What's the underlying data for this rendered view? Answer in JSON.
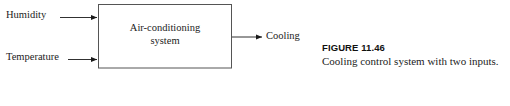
{
  "figure": {
    "block": {
      "label_line1": "Air-conditioning",
      "label_line2": "system",
      "border_color": "#555555",
      "fill_color": "#ffffff"
    },
    "inputs": [
      {
        "label": "Humidity",
        "arrow_name": "humidity-input-arrow"
      },
      {
        "label": "Temperature",
        "arrow_name": "temperature-input-arrow"
      }
    ],
    "outputs": [
      {
        "label": "Cooling",
        "arrow_name": "cooling-output-arrow"
      }
    ],
    "line_color": "#1a1a1a"
  },
  "caption": {
    "title": "FIGURE 11.46",
    "text": "Cooling control system with two inputs."
  },
  "page": {
    "background": "#ffffff"
  }
}
